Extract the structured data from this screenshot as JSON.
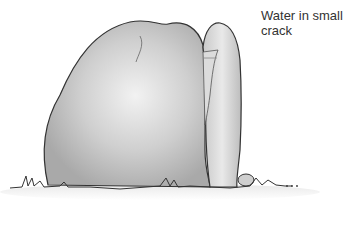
{
  "figure": {
    "annotation": {
      "line1": "Water in small",
      "line2": "crack"
    }
  }
}
